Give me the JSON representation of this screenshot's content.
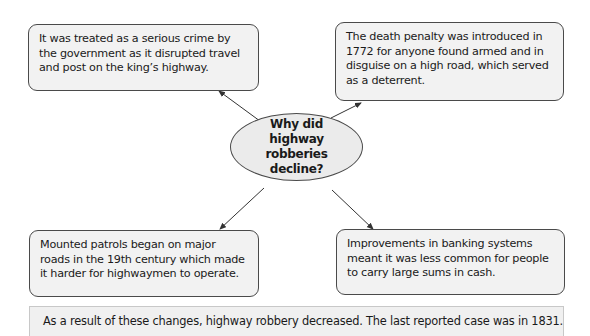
{
  "diagram": {
    "type": "spider-diagram",
    "central_question": "Why did highway robberies decline?",
    "branches": [
      {
        "position": "top-left",
        "text": "It was treated as a serious crime by the government as it disrupted travel and post on the king’s highway."
      },
      {
        "position": "top-right",
        "text": "The death penalty was introduced in 1772 for anyone found armed and in disguise on a high road, which served as a deterrent."
      },
      {
        "position": "bottom-left",
        "text": "Mounted patrols began on major roads in the 19th century which made it harder for highwaymen to operate."
      },
      {
        "position": "bottom-right",
        "text": "Improvements in banking systems meant it was less common for people to carry large sums in cash."
      }
    ],
    "conclusion": "As a result of these changes, highway robbery decreased. The last reported case was in 1831."
  },
  "colors": {
    "box_fill": "#f2f2f2",
    "ellipse_fill": "#ebebeb",
    "border": "#4a4a4a",
    "arrow": "#333333",
    "background": "#ffffff"
  }
}
